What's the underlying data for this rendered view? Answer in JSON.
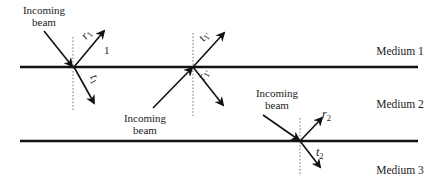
{
  "figure": {
    "media": [
      {
        "label": "Medium 1",
        "x": 400,
        "y": 51
      },
      {
        "label": "Medium 2",
        "x": 400,
        "y": 104
      },
      {
        "label": "Medium 3",
        "x": 400,
        "y": 170
      }
    ],
    "interfaces": [
      {
        "name": "interface-1-2",
        "x1": 20,
        "x2": 418,
        "y": 67
      },
      {
        "name": "interface-2-3",
        "x1": 20,
        "x2": 418,
        "y": 141
      }
    ],
    "beams": [
      {
        "incoming_label_line1": "Incoming",
        "incoming_label_line2": "beam",
        "reflected_symbol": "r",
        "reflected_subscript": "1",
        "transmitted_symbol": "t",
        "transmitted_subscript": "1",
        "region_number": "1"
      },
      {
        "incoming_label_line1": "Incoming",
        "incoming_label_line2": "beam",
        "transmitted_symbol": "t",
        "transmitted_subscript": "1′",
        "reflected_symbol": "r",
        "reflected_subscript": "1′"
      },
      {
        "incoming_label_line1": "Incoming",
        "incoming_label_line2": "beam",
        "reflected_symbol": "r",
        "reflected_subscript": "2",
        "transmitted_symbol": "t",
        "transmitted_subscript": "2"
      }
    ]
  }
}
